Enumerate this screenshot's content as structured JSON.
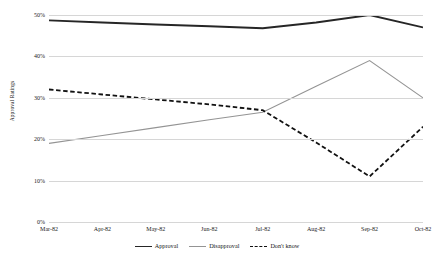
{
  "chart_data": {
    "type": "line",
    "title": "",
    "xlabel": "",
    "ylabel": "Approval Ratings",
    "categories": [
      "Mar-82",
      "Apr-82",
      "May-82",
      "Jun-82",
      "Jul-82",
      "Aug-82",
      "Sep-82",
      "Oct-82"
    ],
    "ylim": [
      0,
      50
    ],
    "yticks": [
      0,
      10,
      20,
      30,
      40,
      50
    ],
    "ytick_labels": [
      "0%",
      "10%",
      "20%",
      "30%",
      "40%",
      "50%"
    ],
    "grid": true,
    "legend_position": "bottom",
    "series": [
      {
        "name": "Approval",
        "color": "#262626",
        "style": "solid",
        "width": 1.9,
        "values": [
          48.7,
          48.2,
          47.7,
          47.3,
          46.8,
          48.2,
          50.0,
          47.0
        ]
      },
      {
        "name": "Disapproval",
        "color": "#949494",
        "style": "solid",
        "width": 1.1,
        "values": [
          19.0,
          20.9,
          22.8,
          24.7,
          26.5,
          32.8,
          39.0,
          30.0
        ]
      },
      {
        "name": "Don't know",
        "color": "#111111",
        "style": "dashed",
        "width": 1.8,
        "values": [
          32.0,
          30.8,
          29.6,
          28.4,
          27.0,
          19.2,
          11.0,
          23.0
        ]
      }
    ]
  },
  "axis": {
    "y_title": "Approval Ratings"
  },
  "legend": {
    "items": [
      {
        "label": "Approval"
      },
      {
        "label": "Disapproval"
      },
      {
        "label": "Don't know"
      }
    ]
  }
}
